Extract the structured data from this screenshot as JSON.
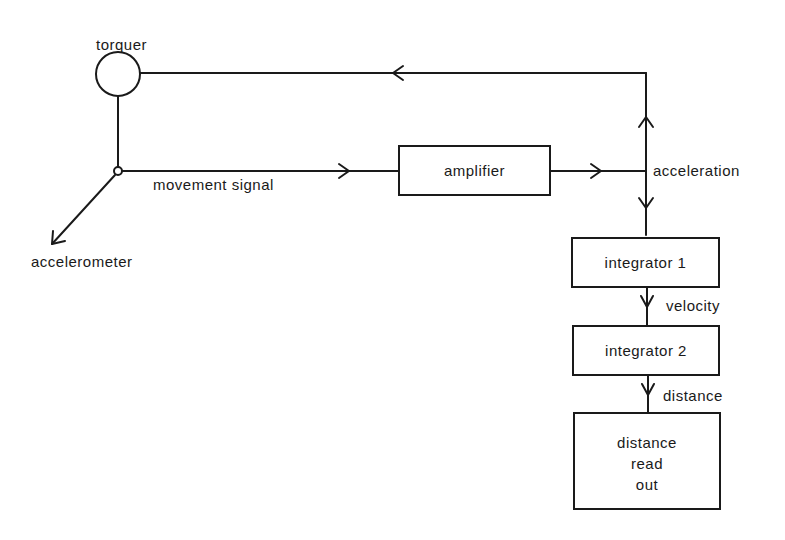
{
  "diagram": {
    "type": "block-diagram",
    "title": "",
    "nodes": {
      "torquer": {
        "label": "torquer",
        "shape": "circle"
      },
      "accelerometer": {
        "label": "accelerometer",
        "shape": "arrow-label"
      },
      "amplifier": {
        "label": "amplifier",
        "shape": "box"
      },
      "integrator1": {
        "label": "integrator 1",
        "shape": "box"
      },
      "integrator2": {
        "label": "integrator 2",
        "shape": "box"
      },
      "readout": {
        "label_lines": [
          "distance",
          "read",
          "out"
        ],
        "shape": "box"
      }
    },
    "edge_labels": {
      "movement_signal": "movement signal",
      "acceleration": "acceleration",
      "velocity": "velocity",
      "distance": "distance"
    },
    "edges": [
      {
        "from": "accelerometer",
        "to": "amplifier",
        "label": "movement signal"
      },
      {
        "from": "amplifier",
        "to": "junction",
        "label": "acceleration"
      },
      {
        "from": "junction",
        "to": "torquer",
        "label": ""
      },
      {
        "from": "junction",
        "to": "integrator1",
        "label": ""
      },
      {
        "from": "integrator1",
        "to": "integrator2",
        "label": "velocity"
      },
      {
        "from": "integrator2",
        "to": "readout",
        "label": "distance"
      }
    ],
    "line_color": "#1a1a1a"
  }
}
